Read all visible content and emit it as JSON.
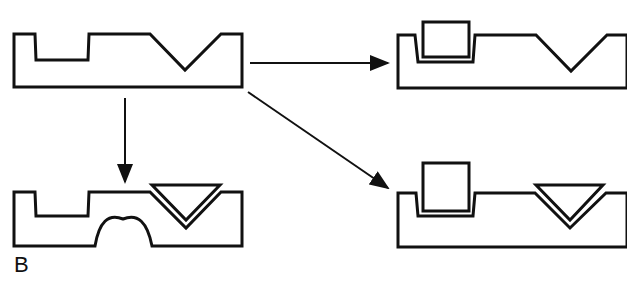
{
  "figure": {
    "panel_label": "B",
    "stroke_color": "#111111",
    "background": "#ffffff",
    "shapes": [
      {
        "id": "original",
        "features": [
          "square-notch",
          "v-groove"
        ]
      },
      {
        "id": "square-insert",
        "features": [
          "square-notch-with-square-insert",
          "v-groove"
        ]
      },
      {
        "id": "square-and-triangle-insert",
        "features": [
          "square-notch-with-square-insert",
          "v-groove-with-triangle-insert"
        ]
      },
      {
        "id": "triangle-insert-arch",
        "features": [
          "square-notch",
          "v-groove-with-triangle-insert",
          "semicircular-cutout-bottom"
        ]
      }
    ],
    "arrows": [
      {
        "from": "original",
        "to": "square-insert",
        "direction": "right"
      },
      {
        "from": "original",
        "to": "square-and-triangle-insert",
        "direction": "down-right"
      },
      {
        "from": "original",
        "to": "triangle-insert-arch",
        "direction": "down"
      }
    ]
  }
}
